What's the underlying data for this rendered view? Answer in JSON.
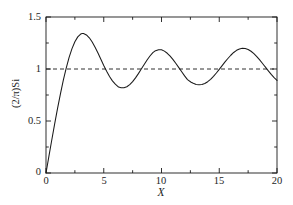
{
  "chart_data": {
    "type": "line",
    "title": "",
    "subtitle": "",
    "xlabel": "X",
    "ylabel": "(2/π)Si",
    "xlim": [
      0,
      20
    ],
    "ylim": [
      0,
      1.5
    ],
    "grid": false,
    "legend": null,
    "x_major_ticks": [
      0,
      5,
      10,
      15,
      20
    ],
    "x_major_tick_labels": [
      "0",
      "5",
      "10",
      "15",
      "20"
    ],
    "x_minor_ticks": [
      2.5,
      7.5,
      12.5,
      17.5
    ],
    "y_major_ticks": [
      0,
      0.5,
      1,
      1.5
    ],
    "y_major_tick_labels": [
      "0",
      "0.5",
      "1",
      "1.5"
    ],
    "y_minor_ticks": [
      0.25,
      0.75,
      1.25
    ],
    "series": [
      {
        "name": "(2/π)Si(X)",
        "style": "solid",
        "color": "#1a1a1a",
        "x": [
          0,
          0.25,
          0.5,
          0.75,
          1,
          1.25,
          1.5,
          1.75,
          2,
          2.25,
          2.5,
          2.75,
          3,
          3.141593,
          3.25,
          3.5,
          3.75,
          4,
          4.25,
          4.5,
          4.75,
          5,
          5.25,
          5.5,
          5.75,
          6,
          6.283185,
          6.5,
          6.75,
          7,
          7.25,
          7.5,
          7.75,
          8,
          8.25,
          8.5,
          8.75,
          9,
          9.25,
          9.424778,
          9.75,
          10,
          10.25,
          10.5,
          10.75,
          11,
          11.25,
          11.5,
          11.75,
          12,
          12.25,
          12.566371,
          12.75,
          13,
          13.25,
          13.5,
          13.75,
          14,
          14.25,
          14.5,
          14.75,
          15,
          15.25,
          15.5,
          15.707963,
          16,
          16.25,
          16.5,
          16.75,
          17,
          17.25,
          17.5,
          17.75,
          18,
          18.25,
          18.5,
          18.75,
          18.849556,
          19,
          19.25,
          19.5,
          19.75,
          20
        ],
        "y": [
          0,
          0.159,
          0.317,
          0.472,
          0.621,
          0.761,
          0.892,
          1.009,
          1.111,
          1.196,
          1.262,
          1.309,
          1.336,
          1.3418,
          1.3405,
          1.3276,
          1.3,
          1.2598,
          1.21,
          1.1533,
          1.0936,
          1.0337,
          0.9775,
          0.9273,
          0.8855,
          0.8537,
          0.8264,
          0.8205,
          0.8196,
          0.8296,
          0.8496,
          0.8785,
          0.9146,
          0.9556,
          0.9995,
          1.0438,
          1.0862,
          1.1247,
          1.1571,
          1.1726,
          1.1845,
          1.1843,
          1.1718,
          1.1512,
          1.1236,
          1.0904,
          1.053,
          1.0132,
          0.9729,
          0.9338,
          0.8979,
          0.8727,
          0.8628,
          0.8519,
          0.8479,
          0.8509,
          0.8611,
          0.878,
          0.901,
          0.9292,
          0.9614,
          0.9963,
          1.0325,
          1.0683,
          1.0963,
          1.1322,
          1.1589,
          1.1795,
          1.193,
          1.1989,
          1.1969,
          1.1873,
          1.1706,
          1.1476,
          1.1195,
          1.0875,
          1.053,
          1.0389,
          1.0175,
          0.9821,
          0.9479,
          0.9165,
          0.8903
        ]
      },
      {
        "name": "reference level",
        "style": "dashed",
        "color": "#1a1a1a",
        "x": [
          0,
          20
        ],
        "y": [
          1,
          1
        ]
      }
    ],
    "annotations": []
  },
  "plot_area": {
    "left_px": 46,
    "right_px": 277,
    "top_px": 17,
    "bottom_px": 173
  }
}
